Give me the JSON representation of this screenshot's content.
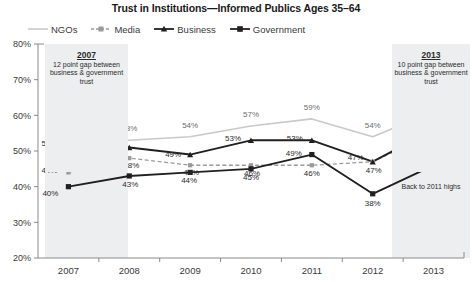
{
  "chart_data": {
    "type": "line",
    "title": "Trust in Institutions—Informed Publics Ages 35–64",
    "xlabel": "",
    "ylabel": "",
    "categories": [
      "2007",
      "2008",
      "2009",
      "2010",
      "2011",
      "2012",
      "2013"
    ],
    "ylim": [
      20,
      80
    ],
    "ytick_labels": [
      "20%",
      "30%",
      "40%",
      "50%",
      "60%",
      "70%",
      "80%"
    ],
    "ytick_values": [
      20,
      30,
      40,
      50,
      60,
      70,
      80
    ],
    "grid": false,
    "legend_position": "top-left",
    "series": [
      {
        "name": "NGOs",
        "color": "#c9c9c9",
        "marker": "none",
        "dash": "solid",
        "values": [
          52,
          53,
          54,
          57,
          59,
          54,
          61
        ],
        "labels": [
          "52%",
          "53%",
          "54%",
          "57%",
          "59%",
          "54%",
          "61%"
        ]
      },
      {
        "name": "Media",
        "color": "#9a9a9a",
        "marker": "square",
        "dash": "dashed",
        "values": [
          44,
          48,
          46,
          46,
          46,
          47,
          55
        ],
        "labels": [
          "44%",
          "48%",
          "46%",
          "46%",
          "46%",
          "47%",
          "55%"
        ]
      },
      {
        "name": "Business",
        "color": "#231f20",
        "marker": "triangle",
        "dash": "solid",
        "values": [
          52,
          51,
          49,
          53,
          53,
          47,
          56
        ],
        "labels": [
          "52%",
          "51%",
          "49%",
          "53%",
          "53%",
          "47%",
          "56%"
        ]
      },
      {
        "name": "Government",
        "color": "#231f20",
        "marker": "square",
        "dash": "solid",
        "values": [
          40,
          43,
          44,
          45,
          49,
          38,
          46
        ],
        "labels": [
          "40%",
          "43%",
          "44%",
          "45%",
          "49%",
          "38%",
          "46%"
        ]
      }
    ],
    "annotations": [
      {
        "id": "anno-2007",
        "title": "2007",
        "body": "12 point gap between business & government trust"
      },
      {
        "id": "anno-2013",
        "title": "2013",
        "body": "10 point gap between business & government trust"
      },
      {
        "id": "note-2013",
        "title": "",
        "body": "Back to 2011 highs"
      }
    ]
  },
  "legend": {
    "items": [
      {
        "label": "NGOs"
      },
      {
        "label": "Media"
      },
      {
        "label": "Business"
      },
      {
        "label": "Government"
      }
    ]
  }
}
